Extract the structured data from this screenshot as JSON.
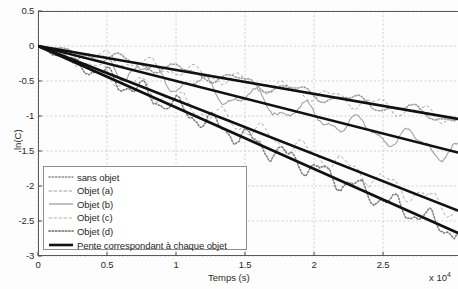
{
  "chart_data": {
    "type": "line",
    "title": "",
    "xlabel": "Temps (s)",
    "ylabel": "ln(C)",
    "x_multiplier": "x 10",
    "x_multiplier_exponent": "4",
    "xlim": [
      0,
      3.043
    ],
    "ylim": [
      -3,
      0.5
    ],
    "xticks": [
      0,
      0.5,
      1,
      1.5,
      2,
      2.5
    ],
    "xtick_labels": [
      "0",
      "0.5",
      "1",
      "1.5",
      "2",
      "2.5"
    ],
    "yticks": [
      0.5,
      0,
      -0.5,
      -1,
      -1.5,
      -2,
      -2.5,
      -3
    ],
    "ytick_labels": [
      "0.5",
      "0",
      "-0.5",
      "-1",
      "-1.5",
      "-2",
      "-2.5",
      "-3"
    ],
    "grid": true,
    "grid_style": "dashed",
    "legend_position": "lower left",
    "series": [
      {
        "name": "sans objet",
        "style": "dotted",
        "color": "#9a9a9a",
        "slope": -0.342,
        "noise_amplitude": 0.045,
        "noise_period": 0.42,
        "endpoint": -1.04
      },
      {
        "name": "Objet (a)",
        "style": "dashed",
        "color": "#a5a5a5",
        "slope": -0.342,
        "noise_amplitude": 0.055,
        "noise_period": 0.33,
        "endpoint": -1.04
      },
      {
        "name": "Objet (b)",
        "style": "solid",
        "color": "#9e9e9e",
        "slope": -0.5,
        "noise_amplitude": 0.085,
        "noise_period": 0.38,
        "endpoint": -1.52
      },
      {
        "name": "Objet (c)",
        "style": "dashed",
        "color": "#ababab",
        "slope": -0.773,
        "noise_amplitude": 0.07,
        "noise_period": 0.3,
        "endpoint": -2.35
      },
      {
        "name": "Objet (d)",
        "style": "dotted",
        "color": "#7c7c7c",
        "slope": -0.878,
        "noise_amplitude": 0.075,
        "noise_period": 0.26,
        "endpoint": -2.67
      }
    ],
    "fit_lines": {
      "name": "Pente correspondant à chaque objet",
      "style": "solid",
      "color": "#111111",
      "width": 2.6,
      "slopes": [
        -0.342,
        -0.5,
        -0.773,
        -0.878
      ],
      "endpoints": [
        -1.04,
        -1.52,
        -2.35,
        -2.67
      ]
    }
  },
  "legend": {
    "items": [
      {
        "label": "sans objet",
        "sample": "dotted"
      },
      {
        "label": "Objet (a)",
        "sample": "dashed"
      },
      {
        "label": "Objet (b)",
        "sample": "solid"
      },
      {
        "label": "Objet (c)",
        "sample": "dashed-light"
      },
      {
        "label": "Objet (d)",
        "sample": "dotted-dark"
      },
      {
        "label": "Pente correspondant à chaque objet",
        "sample": "thick-solid"
      }
    ]
  }
}
